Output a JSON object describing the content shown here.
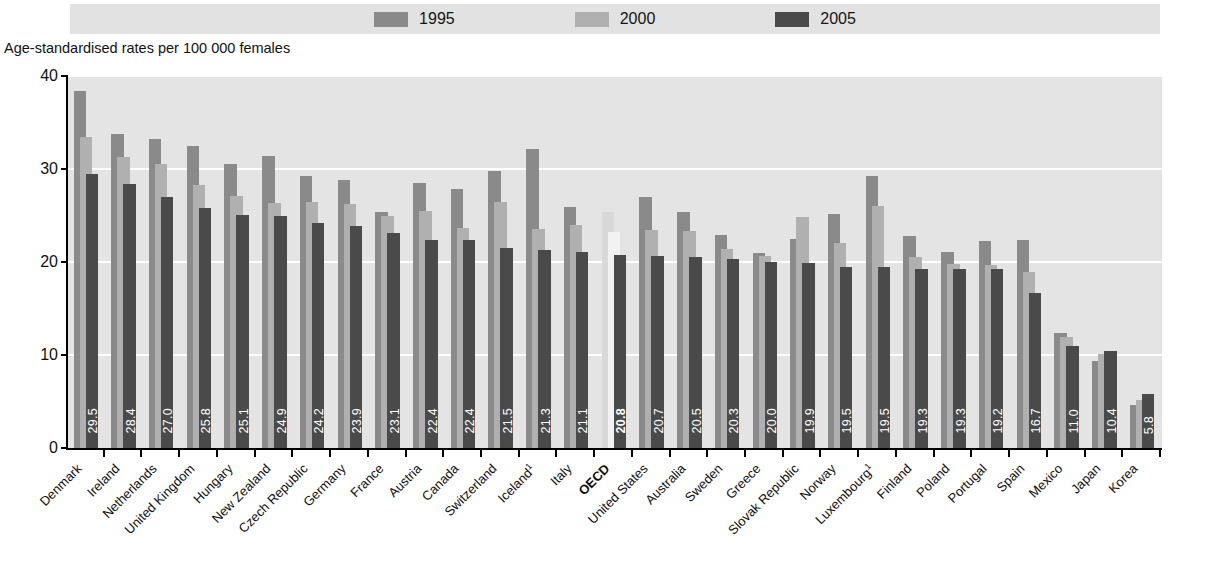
{
  "legend": {
    "items": [
      {
        "label": "1995",
        "color": "#8a8a8a",
        "name": "legend-1995"
      },
      {
        "label": "2000",
        "color": "#b0b0b0",
        "name": "legend-2000"
      },
      {
        "label": "2005",
        "color": "#4a4a4a",
        "name": "legend-2005"
      }
    ]
  },
  "axis_title": "Age-standardised rates per 100 000 females",
  "chart_data": {
    "type": "bar",
    "title": "",
    "subtitle": "",
    "xlabel": "",
    "ylabel": "Age-standardised rates per 100 000 females",
    "ylim": [
      0,
      40
    ],
    "yticks": [
      0,
      10,
      20,
      30,
      40
    ],
    "grid": true,
    "legend_position": "top",
    "bar_style": "overlapping",
    "categories": [
      "Denmark",
      "Ireland",
      "Netherlands",
      "United Kingdom",
      "Hungary",
      "New Zealand",
      "Czech Republic",
      "Germany",
      "France",
      "Austria",
      "Canada",
      "Switzerland",
      "Iceland",
      "Italy",
      "OECD",
      "United States",
      "Australia",
      "Sweden",
      "Greece",
      "Slovak Republic",
      "Norway",
      "Luxembourg",
      "Finland",
      "Poland",
      "Portugal",
      "Spain",
      "Mexico",
      "Japan",
      "Korea"
    ],
    "category_footnotes": {
      "Iceland": "1",
      "Luxembourg": "1"
    },
    "highlight_category": "OECD",
    "series": [
      {
        "name": "1995",
        "color": "#8a8a8a",
        "values": [
          38.4,
          33.8,
          33.2,
          32.5,
          30.5,
          31.4,
          29.2,
          28.8,
          25.4,
          28.5,
          27.9,
          29.8,
          32.2,
          25.9,
          25.4,
          27.0,
          25.4,
          22.9,
          21.0,
          22.5,
          25.2,
          29.3,
          22.8,
          21.1,
          22.3,
          22.4,
          12.4,
          9.4,
          4.6
        ]
      },
      {
        "name": "2000",
        "color": "#b0b0b0",
        "values": [
          33.4,
          31.3,
          30.5,
          28.3,
          27.1,
          26.3,
          26.5,
          26.2,
          24.9,
          25.5,
          23.7,
          26.4,
          23.6,
          24.0,
          23.2,
          23.4,
          23.3,
          21.4,
          20.7,
          24.8,
          22.0,
          26.0,
          20.5,
          19.8,
          19.7,
          18.9,
          11.9,
          10.1,
          5.2
        ]
      },
      {
        "name": "2005",
        "color": "#4a4a4a",
        "values": [
          29.5,
          28.4,
          27.0,
          25.8,
          25.1,
          24.9,
          24.2,
          23.9,
          23.1,
          22.4,
          22.4,
          21.5,
          21.3,
          21.1,
          20.8,
          20.7,
          20.5,
          20.3,
          20.0,
          19.9,
          19.5,
          19.5,
          19.3,
          19.3,
          19.2,
          16.7,
          11.0,
          10.4,
          5.8
        ],
        "data_labels": [
          "29.5",
          "28.4",
          "27.0",
          "25.8",
          "25.1",
          "24.9",
          "24.2",
          "23.9",
          "23.1",
          "22.4",
          "22.4",
          "21.5",
          "21.3",
          "21.1",
          "20.8",
          "20.7",
          "20.5",
          "20.3",
          "20.0",
          "19.9",
          "19.5",
          "19.5",
          "19.3",
          "19.3",
          "19.2",
          "16.7",
          "11.0",
          "10.4",
          "5.8"
        ]
      }
    ]
  }
}
